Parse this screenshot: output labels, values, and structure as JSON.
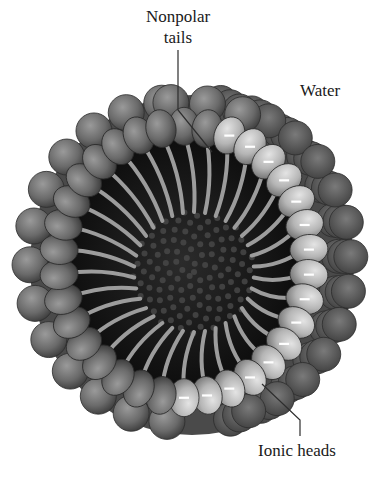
{
  "diagram": {
    "labels": {
      "nonpolar_line1": "Nonpolar",
      "nonpolar_line2": "tails",
      "water": "Water",
      "ionic": "Ionic heads"
    },
    "head_charge_symbol": "–",
    "colors": {
      "background": "#ffffff",
      "outer_heads": "#6e6e6e",
      "light_heads": "#b8b8b8",
      "tails": "#9a9a9a",
      "core": "#151515",
      "text": "#1a1a1a",
      "leader_line": "#333333"
    }
  }
}
